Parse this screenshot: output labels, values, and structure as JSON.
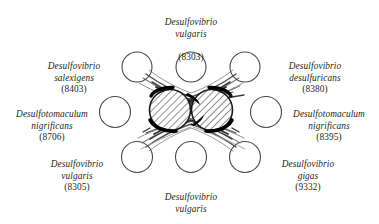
{
  "figure": {
    "title": "",
    "type": "scientific-diagram",
    "colors": {
      "ink": "#231f20",
      "outline": "#4a4a4a",
      "hatch": "#3a3a3a",
      "solid": "#000000",
      "background": "#ffffff"
    },
    "center": {
      "hatched_circle_count": 2,
      "hatched_circles": [
        {
          "cx": 170,
          "cy": 110,
          "r": 21
        },
        {
          "cx": 212,
          "cy": 110,
          "r": 21
        }
      ]
    },
    "ring_circles": [
      {
        "id": "circle-top-center",
        "cx": 191,
        "cy": 67,
        "r": 15
      },
      {
        "id": "circle-top-left",
        "cx": 137,
        "cy": 67,
        "r": 15
      },
      {
        "id": "circle-top-right",
        "cx": 245,
        "cy": 67,
        "r": 15
      },
      {
        "id": "circle-mid-left",
        "cx": 115,
        "cy": 112,
        "r": 15.5
      },
      {
        "id": "circle-mid-right",
        "cx": 266,
        "cy": 112,
        "r": 15.5
      },
      {
        "id": "circle-bottom-left",
        "cx": 137,
        "cy": 157,
        "r": 15.5
      },
      {
        "id": "circle-bottom-center",
        "cx": 191,
        "cy": 157,
        "r": 15.5
      },
      {
        "id": "circle-bottom-right",
        "cx": 245,
        "cy": 157,
        "r": 15.5
      }
    ]
  },
  "labels": {
    "top_center": {
      "genus_species": "Desulfovibrio\nvulgaris",
      "strain": "(8303)"
    },
    "top_left": {
      "genus_species": "Desulfovibrio\nsalexigens",
      "strain": "(8403)"
    },
    "top_right": {
      "genus_species": "Desulfovibrio\ndesulfuricans",
      "strain": "(8380)"
    },
    "mid_left": {
      "genus_species": "Desulfotomaculum\nnigrificans",
      "strain": "(8706)"
    },
    "mid_right": {
      "genus_species": "Desulfotomaculum\nnigrificans",
      "strain": "(8395)"
    },
    "bottom_left": {
      "genus_species": "Desulfovibrio\nvulgaris",
      "strain": "(8305)"
    },
    "bottom_center": {
      "genus_species": "Desulfovibrio\nvulgaris",
      "strain": "(8303)"
    },
    "bottom_right": {
      "genus_species": "Desulfovibrio\ngigas",
      "strain": "(9332)"
    }
  }
}
